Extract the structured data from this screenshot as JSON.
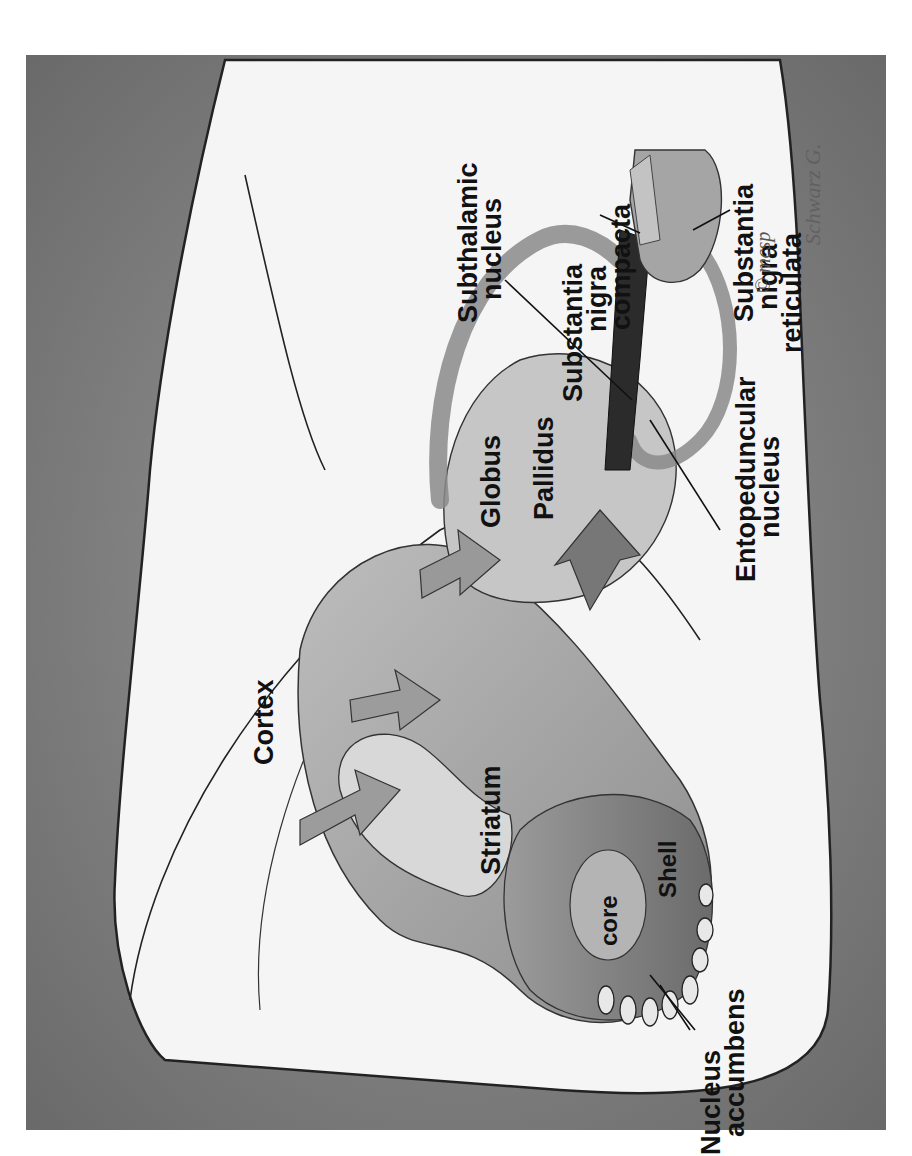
{
  "figure": {
    "type": "anatomical-illustration",
    "orientation": "rotated 90 degrees counter-clockwise",
    "colors": {
      "background_frame": "#7a7a7a",
      "brain_outline_fill": "#f4f4f4",
      "structure_fill": "#a8a8a8",
      "structure_dark": "#6e6e6e",
      "label_text": "#111111"
    }
  },
  "labels": {
    "substantia_nigra_compacta": [
      "Substantia",
      "nigra",
      "compacta"
    ],
    "substantia_nigra_reticulata": [
      "Substantia",
      "nigra",
      "reticulata"
    ],
    "subthalamic_nucleus": [
      "Subthalamic",
      "nucleus"
    ],
    "globus": "Globus",
    "pallidus": "Pallidus",
    "entopeduncular_nucleus": [
      "Entopeduncular",
      "nucleus"
    ],
    "cortex": "Cortex",
    "striatum": "Striatum",
    "core": "core",
    "shell": "Shell",
    "nucleus_accumbens": [
      "Nucleus",
      "accumbens"
    ]
  },
  "copyright": "© mcsp",
  "signature": "Schwarz G."
}
